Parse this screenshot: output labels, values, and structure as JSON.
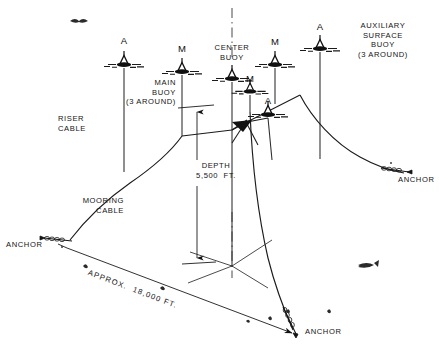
{
  "diagram": {
    "depth_label": "DEPTH\n5,500  FT.",
    "span_label": "APPROX.  18,000 FT.",
    "stroke_color": "#141414",
    "background_color": "#ffffff"
  },
  "labels": {
    "riser_cable": "RISER\nCABLE",
    "mooring_cable": "MOORING\nCABLE",
    "main_buoy": "MAIN\nBUOY\n(3 AROUND)",
    "center_buoy": "CENTER\nBUOY",
    "auxiliary_buoy": "AUXILIARY\nSURFACE\nBUOY\n(3 AROUND)",
    "anchor_left": "ANCHOR",
    "anchor_right": "ANCHOR",
    "anchor_bottom": "ANCHOR"
  },
  "buoys": [
    {
      "id": "aux-left",
      "tag": "A",
      "x": 124,
      "y": 63,
      "tag_y": 36,
      "scale": 1.0
    },
    {
      "id": "main-left",
      "tag": "M",
      "x": 182,
      "y": 70,
      "tag_y": 44,
      "scale": 1.0
    },
    {
      "id": "center",
      "tag": "",
      "x": 232,
      "y": 77,
      "tag_y": 0,
      "scale": 1.0
    },
    {
      "id": "main-right",
      "tag": "M",
      "x": 275,
      "y": 63,
      "tag_y": 37,
      "scale": 1.0
    },
    {
      "id": "main-inner",
      "tag": "M",
      "x": 250,
      "y": 90,
      "tag_y": 74,
      "scale": 0.92
    },
    {
      "id": "aux-inner",
      "tag": "A",
      "x": 268,
      "y": 113,
      "tag_y": 96,
      "scale": 1.0
    },
    {
      "id": "aux-right",
      "tag": "A",
      "x": 320,
      "y": 47,
      "tag_y": 22,
      "scale": 1.0
    }
  ],
  "anchors": [
    {
      "id": "anchor-left",
      "label_x": 6,
      "label_y": 240
    },
    {
      "id": "anchor-right",
      "label_x": 398,
      "label_y": 175
    },
    {
      "id": "anchor-bottom",
      "label_x": 305,
      "label_y": 327
    }
  ]
}
